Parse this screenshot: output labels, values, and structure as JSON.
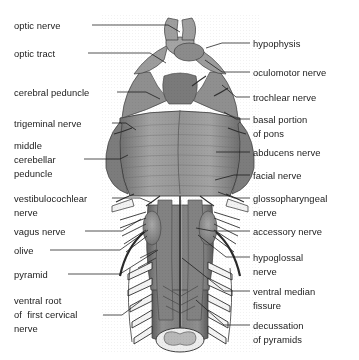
{
  "figure": {
    "background_color": "#ffffff",
    "ink_color": "#1a1a1a",
    "anatomy_fill": "#8a8a8a",
    "anatomy_shadow": "#5f5f5f",
    "anatomy_highlight": "#b5b5b5",
    "cut_surface_color": "#ededed"
  },
  "labels_left": [
    {
      "id": "optic-nerve",
      "lines": [
        "optic nerve"
      ],
      "x": 14,
      "y": 19
    },
    {
      "id": "optic-tract",
      "lines": [
        "optic tract"
      ],
      "x": 14,
      "y": 47
    },
    {
      "id": "cerebral-peduncle",
      "lines": [
        "cerebral peduncle"
      ],
      "x": 14,
      "y": 86
    },
    {
      "id": "trigeminal-nerve",
      "lines": [
        "trigeminal nerve"
      ],
      "x": 14,
      "y": 117
    },
    {
      "id": "middle-cerebellar-peduncle",
      "lines": [
        "middle",
        "cerebellar",
        "peduncle"
      ],
      "x": 14,
      "y": 139
    },
    {
      "id": "vestibulocochlear-nerve",
      "lines": [
        "vestibulocochlear",
        "nerve"
      ],
      "x": 14,
      "y": 192
    },
    {
      "id": "vagus-nerve",
      "lines": [
        "vagus nerve"
      ],
      "x": 14,
      "y": 225
    },
    {
      "id": "olive",
      "lines": [
        "olive"
      ],
      "x": 14,
      "y": 244
    },
    {
      "id": "pyramid",
      "lines": [
        "pyramid"
      ],
      "x": 14,
      "y": 268
    },
    {
      "id": "ventral-root-first-cervical-nerve",
      "lines": [
        "ventral root",
        "of  first cervical",
        "nerve"
      ],
      "x": 14,
      "y": 294
    }
  ],
  "labels_right": [
    {
      "id": "hypophysis",
      "lines": [
        "hypophysis"
      ],
      "x": 253,
      "y": 37
    },
    {
      "id": "oculomotor-nerve",
      "lines": [
        "oculomotor nerve"
      ],
      "x": 253,
      "y": 66
    },
    {
      "id": "trochlear-nerve",
      "lines": [
        "trochlear nerve"
      ],
      "x": 253,
      "y": 91
    },
    {
      "id": "basal-portion-of-pons",
      "lines": [
        "basal portion",
        "of pons"
      ],
      "x": 253,
      "y": 113
    },
    {
      "id": "abducens-nerve",
      "lines": [
        "abducens nerve"
      ],
      "x": 253,
      "y": 146
    },
    {
      "id": "facial-nerve",
      "lines": [
        "facial nerve"
      ],
      "x": 253,
      "y": 169
    },
    {
      "id": "glossopharyngeal-nerve",
      "lines": [
        "glossopharyngeal",
        "nerve"
      ],
      "x": 253,
      "y": 192
    },
    {
      "id": "accessory-nerve",
      "lines": [
        "accessory nerve"
      ],
      "x": 253,
      "y": 225
    },
    {
      "id": "hypoglossal-nerve",
      "lines": [
        "hypoglossal",
        "nerve"
      ],
      "x": 253,
      "y": 251
    },
    {
      "id": "ventral-median-fissure",
      "lines": [
        "ventral median",
        "fissure"
      ],
      "x": 253,
      "y": 285
    },
    {
      "id": "decussation-of-pyramids",
      "lines": [
        "decussation",
        "of pyramids"
      ],
      "x": 253,
      "y": 319
    }
  ],
  "leaders": [
    {
      "id": "leader-optic-nerve",
      "points": "92,25 168,25 180,32"
    },
    {
      "id": "leader-optic-tract",
      "points": "88,53 150,53 166,63"
    },
    {
      "id": "leader-cerebral-peduncle",
      "points": "117,92 146,92 160,99"
    },
    {
      "id": "leader-trigeminal-nerve",
      "points": "112,123 126,123 136,130"
    },
    {
      "id": "leader-middle-cerebellar-peduncle",
      "points": "84,159 120,159 128,155"
    },
    {
      "id": "leader-vestibulocochlear-nerve",
      "points": "112,198 140,198 152,203"
    },
    {
      "id": "leader-vagus-nerve",
      "points": "85,231 122,231 141,219"
    },
    {
      "id": "leader-olive",
      "points": "50,250 120,250 148,230"
    },
    {
      "id": "leader-pyramid",
      "points": "68,274 120,274 158,250"
    },
    {
      "id": "leader-ventral-root",
      "points": "103,315 122,315 142,300"
    },
    {
      "id": "leader-hypophysis",
      "points": "250,43 222,43 206,48"
    },
    {
      "id": "leader-oculomotor-nerve",
      "points": "250,72 222,72 205,60"
    },
    {
      "id": "leader-trochlear-nerve",
      "points": "250,97 236,97 222,85"
    },
    {
      "id": "leader-basal-portion-of-pons",
      "points": "250,119 236,119 224,112"
    },
    {
      "id": "leader-abducens-nerve",
      "points": "250,152 232,152 216,152"
    },
    {
      "id": "leader-facial-nerve",
      "points": "250,175 234,175 215,180"
    },
    {
      "id": "leader-glossopharyngeal-nerve",
      "points": "250,198 234,198 218,192"
    },
    {
      "id": "leader-accessory-nerve",
      "points": "250,231 212,231 196,228"
    },
    {
      "id": "leader-hypoglossal-nerve",
      "points": "250,257 226,257 198,235"
    },
    {
      "id": "leader-ventral-median-fissure",
      "points": "250,291 224,291 182,258"
    },
    {
      "id": "leader-decussation-of-pyramids",
      "points": "250,325 224,325 196,300"
    }
  ]
}
